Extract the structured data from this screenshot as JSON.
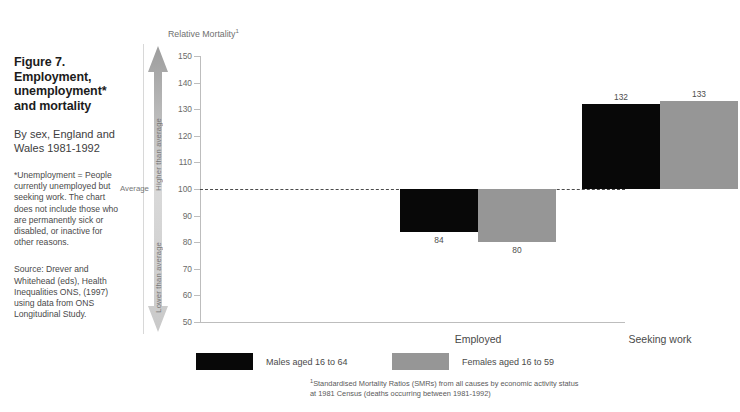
{
  "figure": {
    "title": "Figure 7.\nEmployment,\nunemployment*\nand mortality",
    "subtitle": "By sex, England and\nWales 1981-1992",
    "note": "*Unemployment = People\ncurrently unemployed but\nseeking work.  The chart\ndoes not include those who\nare permanently sick or\ndisabled, or inactive for\nother reasons.",
    "source": "Source: Drever and\nWhitehead (eds), Health\nInequalities ONS, (1997)\nusing data from ONS\nLongitudinal Study."
  },
  "gauge": {
    "higher_label": "Higher than average",
    "average_label": "Average",
    "lower_label": "Lower than average"
  },
  "footnote": {
    "marker": "1",
    "text": "Standardised Mortality Ratios (SMRs) from all causes by economic activity status\nat 1981 Census (deaths occurring between 1981-1992)"
  },
  "colors": {
    "male": "#080808",
    "female": "#969696",
    "axis": "#bdbdbd",
    "average_line": "#4a4a4a"
  },
  "chart_data": {
    "type": "bar",
    "title": "Relative Mortality",
    "title_superscript": "1",
    "xlabel": "",
    "ylabel": "",
    "categories": [
      "Employed",
      "Seeking work"
    ],
    "series": [
      {
        "name": "Males aged 16 to 64",
        "values": [
          84,
          132
        ],
        "color": "#080808"
      },
      {
        "name": "Females aged 16 to 59",
        "values": [
          80,
          133
        ],
        "color": "#969696"
      }
    ],
    "ylim": [
      50,
      150
    ],
    "yticks": [
      150,
      140,
      130,
      120,
      110,
      100,
      90,
      80,
      70,
      60,
      50
    ],
    "reference_line": 100,
    "reference_line_style": "dashed",
    "grid": false,
    "legend_position": "bottom"
  }
}
